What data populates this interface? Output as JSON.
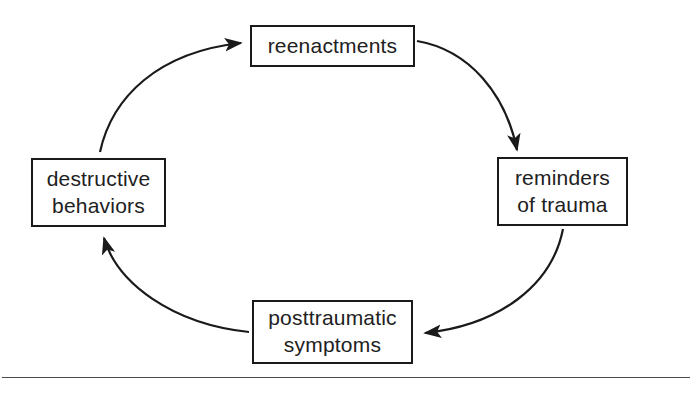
{
  "figure": {
    "type": "cycle-diagram",
    "direction": "clockwise",
    "background_color": "#ffffff",
    "line_color": "#1a1a1a",
    "text_color": "#212121"
  },
  "nodes": [
    {
      "id": "reenactments",
      "label": "reenactments",
      "position": "top"
    },
    {
      "id": "reminders-of-trauma",
      "label": "reminders\nof trauma",
      "position": "right"
    },
    {
      "id": "posttraumatic-symptoms",
      "label": "posttraumatic\nsymptoms",
      "position": "bottom"
    },
    {
      "id": "destructive-behaviors",
      "label": "destructive\nbehaviors",
      "position": "left"
    }
  ],
  "edges": [
    {
      "id": "reenactments-to-reminders",
      "from": "reenactments",
      "to": "reminders-of-trauma",
      "arrowhead": "end"
    },
    {
      "id": "reminders-to-posttraumatic",
      "from": "reminders-of-trauma",
      "to": "posttraumatic-symptoms",
      "arrowhead": "end"
    },
    {
      "id": "posttraumatic-to-destructive",
      "from": "posttraumatic-symptoms",
      "to": "destructive-behaviors",
      "arrowhead": "end"
    },
    {
      "id": "destructive-to-reenactments",
      "from": "destructive-behaviors",
      "to": "reenactments",
      "arrowhead": "end"
    }
  ],
  "rule": {
    "name": "page-divider-rule",
    "color": "#4a4a4a"
  }
}
